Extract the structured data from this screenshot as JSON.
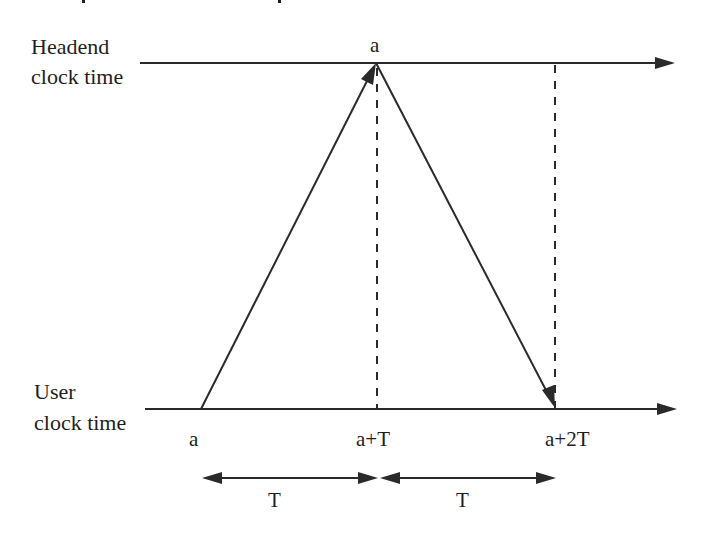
{
  "diagram": {
    "type": "timing-diagram",
    "headend_axis": {
      "label_line1": "Headend",
      "label_line2": "clock time",
      "apex_label": "a"
    },
    "user_axis": {
      "label_line1": "User",
      "label_line2": "clock time",
      "ticks": [
        {
          "label": "a"
        },
        {
          "label": "a+T"
        },
        {
          "label": "a+2T"
        }
      ]
    },
    "intervals": [
      {
        "label": "T"
      },
      {
        "label": "T"
      }
    ],
    "colors": {
      "ink": "#2a2a2a",
      "background": "#ffffff"
    }
  }
}
